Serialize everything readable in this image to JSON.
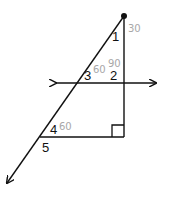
{
  "diagram": {
    "type": "geometry-figure",
    "colors": {
      "stroke": "#111111",
      "handwriting": "#a8a8a8",
      "background": "#ffffff"
    },
    "angle_labels": [
      {
        "id": "1",
        "text": "1"
      },
      {
        "id": "2",
        "text": "2"
      },
      {
        "id": "3",
        "text": "3"
      },
      {
        "id": "4",
        "text": "4"
      },
      {
        "id": "5",
        "text": "5"
      }
    ],
    "handwritten_annotations": [
      {
        "near": "angle-1",
        "text": "30"
      },
      {
        "near": "angle-3",
        "text": "60"
      },
      {
        "near": "angle-2",
        "text": "90"
      },
      {
        "near": "angle-4",
        "text": "60"
      }
    ],
    "marks": {
      "right_angle": "bottom-right-vertex",
      "apex_point": "top-vertex-dot"
    },
    "arrows": [
      "transversal-left",
      "transversal-right",
      "slanted-ray-bottom-left"
    ]
  }
}
